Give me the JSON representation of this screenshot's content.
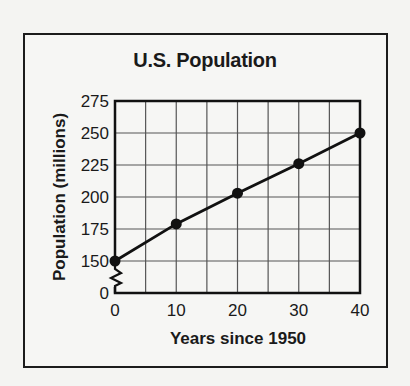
{
  "chart_data": {
    "type": "line",
    "title": "U.S. Population",
    "xlabel": "Years since 1950",
    "ylabel": "Population (millions)",
    "x": [
      0,
      10,
      20,
      30,
      40
    ],
    "series": [
      {
        "name": "U.S. Population",
        "values": [
          150,
          179,
          203,
          226,
          250
        ],
        "markers": true
      }
    ],
    "xticks": [
      "0",
      "10",
      "20",
      "30",
      "40"
    ],
    "yticks": [
      "0",
      "150",
      "175",
      "200",
      "225",
      "250",
      "275"
    ],
    "xlim": [
      0,
      40
    ],
    "ylim": [
      150,
      275
    ],
    "y_axis_break": true,
    "grid": true,
    "grid_step_x": 5,
    "grid_step_y": 25,
    "legend": "none"
  },
  "colors": {
    "line": "#111111",
    "grid": "#555555",
    "background": "#f6f6f4"
  }
}
